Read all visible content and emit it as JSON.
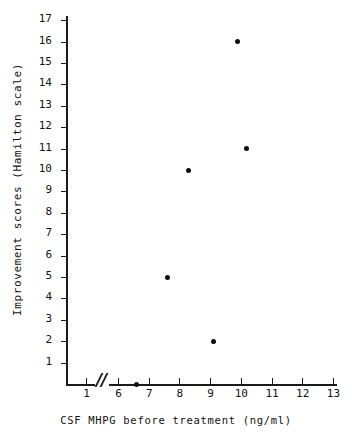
{
  "chart_data": {
    "type": "scatter",
    "title": "",
    "xlabel": "CSF MHPG before treatment (ng/ml)",
    "ylabel": "Improvement scores (Hamilton scale)",
    "xlim": [
      0.4,
      16.4
    ],
    "ylim": [
      0,
      17.6
    ],
    "grid": false,
    "legend": null,
    "axis_break": {
      "after": 1,
      "before": 6,
      "marker": "//"
    },
    "xticks": [
      1,
      6,
      7,
      8,
      9,
      10,
      11,
      12,
      13,
      14,
      15,
      16
    ],
    "xtick_labels": [
      "1",
      "6",
      "7",
      "8",
      "9",
      "10",
      "11",
      "12",
      "13",
      "14",
      "15",
      "16"
    ],
    "yticks": [
      1,
      2,
      3,
      4,
      5,
      6,
      7,
      8,
      9,
      10,
      11,
      12,
      13,
      14,
      15,
      16,
      17
    ],
    "ytick_labels": [
      "1",
      "2",
      "3",
      "4",
      "5",
      "6",
      "7",
      "8",
      "9",
      "10",
      "11",
      "12",
      "13",
      "14",
      "15",
      "16",
      "17"
    ],
    "marker": "filled-circle",
    "marker_color": "#0d0d0d",
    "points": [
      {
        "x": 6.6,
        "y": 0
      },
      {
        "x": 7.6,
        "y": 5
      },
      {
        "x": 8.3,
        "y": 10
      },
      {
        "x": 9.1,
        "y": 2
      },
      {
        "x": 9.9,
        "y": 16
      },
      {
        "x": 10.2,
        "y": 11
      },
      {
        "x": 14.6,
        "y": 17
      },
      {
        "x": 15.8,
        "y": 13
      }
    ]
  },
  "axes": {
    "x_title": "CSF MHPG before treatment (ng/ml)",
    "y_title": "Improvement scores (Hamilton scale)"
  }
}
